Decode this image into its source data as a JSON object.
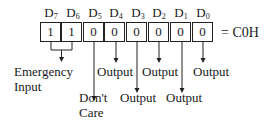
{
  "register": {
    "bits": [
      {
        "name": "D",
        "sub": "7",
        "value": "1"
      },
      {
        "name": "D",
        "sub": "6",
        "value": "1"
      },
      {
        "name": "D",
        "sub": "5",
        "value": "0"
      },
      {
        "name": "D",
        "sub": "4",
        "value": "0"
      },
      {
        "name": "D",
        "sub": "3",
        "value": "0"
      },
      {
        "name": "D",
        "sub": "2",
        "value": "0"
      },
      {
        "name": "D",
        "sub": "1",
        "value": "0"
      },
      {
        "name": "D",
        "sub": "0",
        "value": "0"
      }
    ],
    "result": "= C0H"
  },
  "annotations": {
    "emergency_line1": "Emergency",
    "emergency_line2": "Input",
    "dontcare_line1": "Don't",
    "dontcare_line2": "Care",
    "d4": "Output",
    "d3": "Output",
    "d2": "Output",
    "d1": "Output",
    "d0": "Output"
  }
}
